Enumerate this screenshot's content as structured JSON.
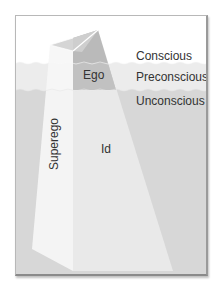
{
  "diagram": {
    "levels": [
      {
        "label": "Conscious"
      },
      {
        "label": "Preconscious"
      },
      {
        "label": "Unconscious"
      }
    ],
    "structures": {
      "ego": "Ego",
      "superego": "Superego",
      "id": "Id"
    },
    "colors": {
      "sky": "#ffffff",
      "preconscious_water": "#ececec",
      "unconscious_water": "#d6d6d6",
      "ego_face": "#a9a9a9",
      "berg_light": "#f4f4f4",
      "berg_mid": "#e6e6e6",
      "frame": "#9a9a9a"
    }
  }
}
